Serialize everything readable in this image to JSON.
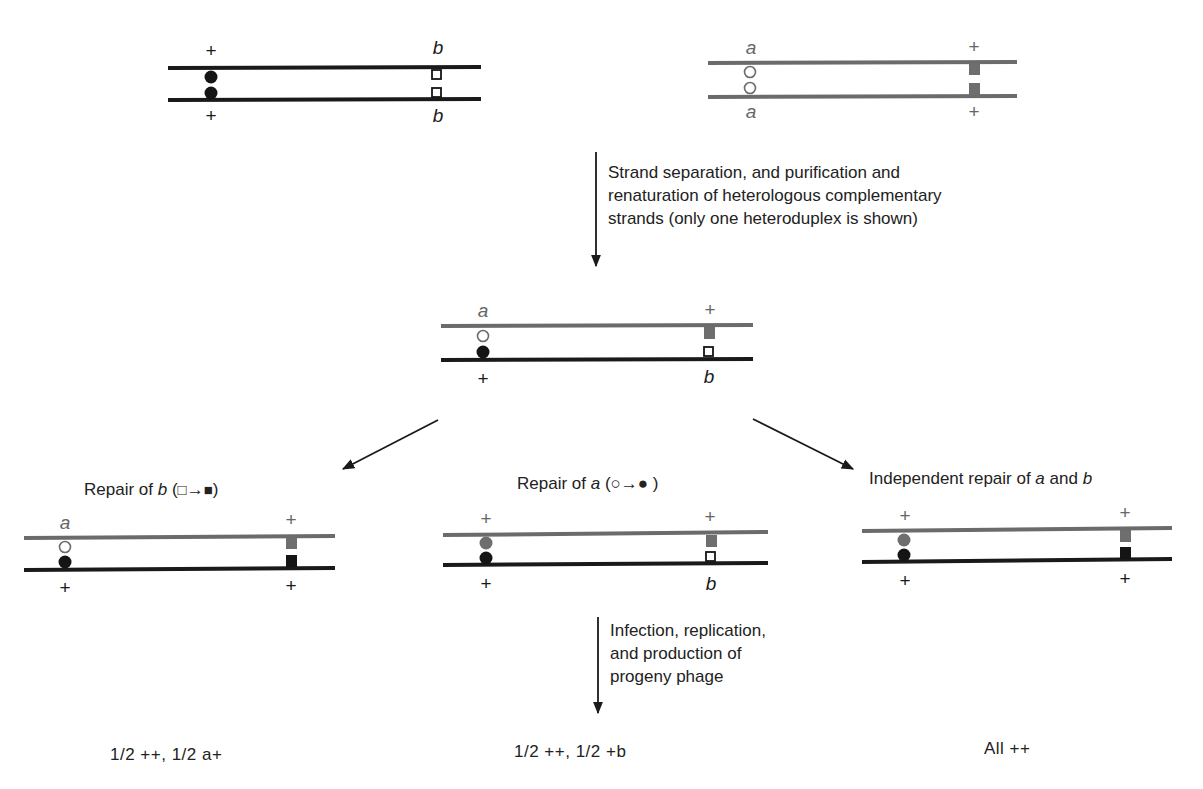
{
  "colors": {
    "strand_black": "#1a1a1a",
    "strand_gray": "#6b6b6b",
    "marker_black": "#151515",
    "marker_gray": "#6e6e6e",
    "background": "#ffffff"
  },
  "parent_duplex_1": {
    "top_left_label": "+",
    "top_right_label": "b",
    "bottom_left_label": "+",
    "bottom_right_label": "b",
    "strand_color": "black",
    "left_markers": "filled-circle",
    "right_markers": "open-square"
  },
  "parent_duplex_2": {
    "top_left_label": "a",
    "top_right_label": "+",
    "bottom_left_label": "a",
    "bottom_right_label": "+",
    "strand_color": "gray",
    "left_markers": "open-circle",
    "right_markers": "filled-square"
  },
  "step1": {
    "lines": [
      "Strand separation, and purification and",
      "renaturation of heterologous complementary",
      "strands (only one heteroduplex is shown)"
    ]
  },
  "heteroduplex": {
    "top_left_label": "a",
    "top_right_label": "+",
    "bottom_left_label": "+",
    "bottom_right_label": "b"
  },
  "repairs": [
    {
      "caption_prefix": "Repair of ",
      "caption_italic": "b",
      "caption_suffix": " (",
      "caption_from": "□",
      "caption_arrow": "→",
      "caption_to": "■",
      "caption_end": ")",
      "top_left_label": "a",
      "top_right_label": "+",
      "bottom_left_label": "+",
      "bottom_right_label": "+",
      "outcome": "1/2 ++,  1/2 a+"
    },
    {
      "caption_prefix": "Repair of ",
      "caption_italic": "a",
      "caption_suffix": " (",
      "caption_from": "○",
      "caption_arrow": "→",
      "caption_to": "●",
      "caption_end": " )",
      "top_left_label": "+",
      "top_right_label": "+",
      "bottom_left_label": "+",
      "bottom_right_label": "b",
      "outcome": "1/2 ++,  1/2 +b"
    },
    {
      "caption_prefix": "Independent repair of ",
      "caption_italic": "a",
      "caption_middle": " and ",
      "caption_italic2": "b",
      "top_left_label": "+",
      "top_right_label": "+",
      "bottom_left_label": "+",
      "bottom_right_label": "+",
      "outcome": "All ++"
    }
  ],
  "step2": {
    "lines": [
      "Infection, replication,",
      "and production of",
      "progeny phage"
    ]
  }
}
